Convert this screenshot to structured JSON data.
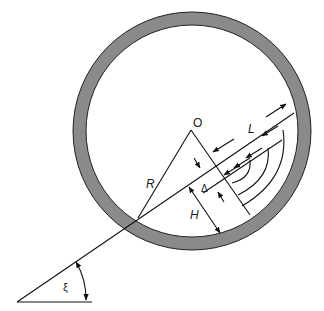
{
  "diagram": {
    "colors": {
      "wall_fill": "#8a8a8a",
      "wall_edge": "#222222",
      "line": "#111111",
      "background": "#ffffff"
    },
    "labels": {
      "center": "O",
      "radius": "R",
      "length": "L",
      "height": "H",
      "delta": "Δ",
      "angle": "ξ"
    }
  }
}
